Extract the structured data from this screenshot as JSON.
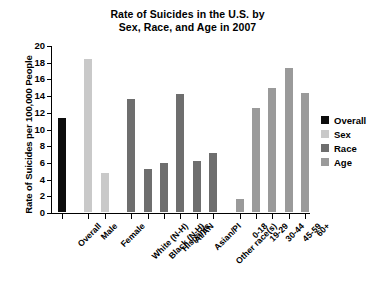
{
  "chart_data": {
    "type": "bar",
    "title": "Rate of Suicides in the U.S. by Sex, Race, and Age in 2007",
    "title_lines": [
      "Rate of Suicides in the U.S. by",
      "Sex, Race, and Age in 2007"
    ],
    "xlabel": "",
    "ylabel": "Rate of Suicides per 100,000 People",
    "ylim": [
      0,
      20
    ],
    "ytick_step": 2,
    "yticks": [
      "20",
      "18",
      "16",
      "14",
      "12",
      "10",
      "8",
      "6",
      "4",
      "2",
      "0"
    ],
    "grid": false,
    "legend_position": "right",
    "categories": [
      "Overall",
      "Male",
      "Female",
      "White (N-H)",
      "Black (N-H)",
      "Hispanic",
      "AI/AN",
      "Asian/PI",
      "Other race(s)",
      "0-18",
      "19-29",
      "30-44",
      "45-59",
      "60+"
    ],
    "values": [
      11.3,
      18.3,
      4.7,
      13.5,
      5.1,
      5.9,
      14.1,
      6.1,
      7.1,
      1.5,
      12.4,
      14.8,
      17.2,
      14.3
    ],
    "groups": [
      "Overall",
      "Sex",
      "Sex",
      "Race",
      "Race",
      "Race",
      "Race",
      "Race",
      "Race",
      "Age",
      "Age",
      "Age",
      "Age",
      "Age"
    ],
    "series": [
      {
        "name": "Overall",
        "color": "#0d0d0d",
        "points": [
          {
            "category": "Overall",
            "value": 11.3
          }
        ]
      },
      {
        "name": "Sex",
        "color": "#c9c9c9",
        "points": [
          {
            "category": "Male",
            "value": 18.3
          },
          {
            "category": "Female",
            "value": 4.7
          }
        ]
      },
      {
        "name": "Race",
        "color": "#6e6e6e",
        "points": [
          {
            "category": "White (N-H)",
            "value": 13.5
          },
          {
            "category": "Black (N-H)",
            "value": 5.1
          },
          {
            "category": "Hispanic",
            "value": 5.9
          },
          {
            "category": "AI/AN",
            "value": 14.1
          },
          {
            "category": "Asian/PI",
            "value": 6.1
          },
          {
            "category": "Other race(s)",
            "value": 7.1
          }
        ]
      },
      {
        "name": "Age",
        "color": "#9a9a9a",
        "points": [
          {
            "category": "0-18",
            "value": 1.5
          },
          {
            "category": "19-29",
            "value": 12.4
          },
          {
            "category": "30-44",
            "value": 14.8
          },
          {
            "category": "45-59",
            "value": 17.2
          },
          {
            "category": "60+",
            "value": 14.3
          }
        ]
      }
    ],
    "legend": [
      {
        "label": "Overall",
        "color": "#0d0d0d"
      },
      {
        "label": "Sex",
        "color": "#c9c9c9"
      },
      {
        "label": "Race",
        "color": "#6e6e6e"
      },
      {
        "label": "Age",
        "color": "#9a9a9a"
      }
    ]
  }
}
